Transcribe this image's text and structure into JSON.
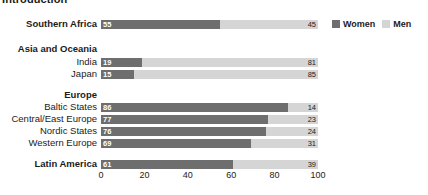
{
  "title_cut": "Introduction",
  "legend": {
    "women_label": "Women",
    "men_label": "Men",
    "women_color": "#6e6e6e",
    "men_color": "#d5d5d5"
  },
  "axis": {
    "ticks": [
      "0",
      "20",
      "40",
      "60",
      "80",
      "100"
    ],
    "min": 0,
    "max": 100
  },
  "rows": [
    {
      "label": "Southern Africa",
      "type": "bar",
      "bold": true,
      "women": 55,
      "men": 45,
      "top": 18
    },
    {
      "label": "Asia and Oceania",
      "type": "group",
      "bold": true,
      "women": null,
      "men": null,
      "top": 43
    },
    {
      "label": "India",
      "type": "bar",
      "bold": false,
      "women": 19,
      "men": 81,
      "top": 56
    },
    {
      "label": "Japan",
      "type": "bar",
      "bold": false,
      "women": 15,
      "men": 85,
      "top": 68
    },
    {
      "label": "Europe",
      "type": "group",
      "bold": true,
      "women": null,
      "men": null,
      "top": 89
    },
    {
      "label": "Baltic States",
      "type": "bar",
      "bold": false,
      "women": 86,
      "men": 14,
      "top": 101
    },
    {
      "label": "Central/East Europe",
      "type": "bar",
      "bold": false,
      "women": 77,
      "men": 23,
      "top": 113
    },
    {
      "label": "Nordic States",
      "type": "bar",
      "bold": false,
      "women": 76,
      "men": 24,
      "top": 125
    },
    {
      "label": "Western Europe",
      "type": "bar",
      "bold": false,
      "women": 69,
      "men": 31,
      "top": 137
    },
    {
      "label": "Latin America",
      "type": "bar",
      "bold": true,
      "women": 61,
      "men": 39,
      "top": 158
    }
  ],
  "chart_data": {
    "type": "bar",
    "title": "Introduction",
    "xlabel": "",
    "ylabel": "",
    "xlim": [
      0,
      100
    ],
    "grid": false,
    "legend_position": "top-right",
    "orientation": "horizontal",
    "stacked": true,
    "stacked_percent": true,
    "categories": [
      "Southern Africa",
      "India",
      "Japan",
      "Baltic States",
      "Central/East Europe",
      "Nordic States",
      "Western Europe",
      "Latin America"
    ],
    "group_headers": [
      "Asia and Oceania",
      "Europe"
    ],
    "series": [
      {
        "name": "Women",
        "color": "#6e6e6e",
        "values": [
          55,
          19,
          15,
          86,
          77,
          76,
          69,
          61
        ]
      },
      {
        "name": "Men",
        "color": "#d5d5d5",
        "values": [
          45,
          81,
          85,
          14,
          23,
          24,
          31,
          39
        ]
      }
    ],
    "xticks": [
      0,
      20,
      40,
      60,
      80,
      100
    ]
  }
}
